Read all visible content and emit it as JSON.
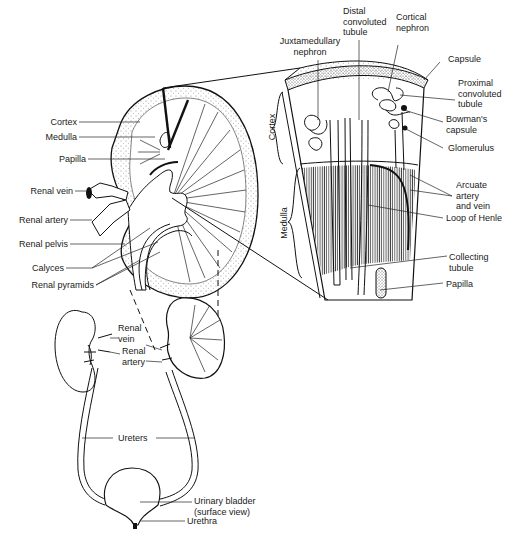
{
  "diagram": {
    "title": "",
    "kidney_section": {
      "labels": {
        "cortex": "Cortex",
        "medulla": "Medulla",
        "papilla": "Papilla",
        "renal_vein": "Renal vein",
        "renal_artery": "Renal artery",
        "renal_pelvis": "Renal pelvis",
        "calyces": "Calyces",
        "renal_pyramids": "Renal pyramids"
      }
    },
    "nephron_wedge": {
      "labels": {
        "juxtamedullary_nephron_1": "Juxtamedullary",
        "juxtamedullary_nephron_2": "nephron",
        "distal_1": "Distal",
        "distal_2": "convoluted",
        "distal_3": "tubule",
        "cortical_1": "Cortical",
        "cortical_2": "nephron",
        "capsule": "Capsule",
        "proximal_1": "Proximal",
        "proximal_2": "convoluted",
        "proximal_3": "tubule",
        "bowmans_1": "Bowman's",
        "bowmans_2": "capsule",
        "glomerulus": "Glomerulus",
        "arcuate_1": "Arcuate",
        "arcuate_2": "artery",
        "arcuate_3": "and vein",
        "loop_of_henle": "Loop of Henle",
        "collecting_1": "Collecting",
        "collecting_2": "tubule",
        "papilla": "Papilla",
        "cortex_side": "Cortex",
        "medulla_side": "Medulla"
      }
    },
    "urinary_system": {
      "labels": {
        "renal_vein_1": "Renal",
        "renal_vein_2": "vein",
        "renal_artery_1": "Renal",
        "renal_artery_2": "artery",
        "ureters": "Ureters",
        "bladder_1": "Urinary bladder",
        "bladder_2": "(surface view)",
        "urethra": "Urethra"
      }
    }
  }
}
